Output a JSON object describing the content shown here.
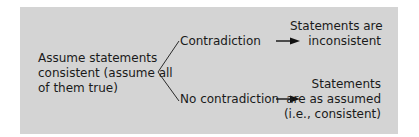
{
  "diagram": {
    "root": {
      "lines": [
        "Assume statements",
        "consistent (assume all",
        "of them true)"
      ]
    },
    "branches": [
      {
        "condition": "Contradiction",
        "outcome_lines": [
          "Statements are",
          "inconsistent"
        ]
      },
      {
        "condition": "No contradiction",
        "outcome_lines": [
          "Statements",
          "are as assumed",
          "(i.e., consistent)"
        ]
      }
    ],
    "colors": {
      "panel": "#d4d4d4",
      "text": "#1a1a1a",
      "lines": "#2a2a2a"
    }
  }
}
